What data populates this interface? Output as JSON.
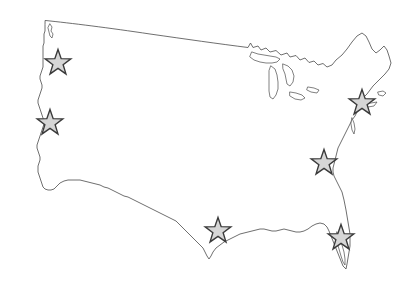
{
  "figure": {
    "background_color": "#ffffff",
    "width": 414,
    "height": 287
  },
  "map": {
    "region_name": "Contiguous United States",
    "outline_color": "#4a4a4a",
    "fill_color": "#ffffff",
    "lakes": [
      "Lake Superior",
      "Lake Michigan",
      "Lake Huron",
      "Lake Erie",
      "Lake Ontario"
    ]
  },
  "legend": {
    "marker_shape": "star",
    "marker_fill_color": "#d6d6d6",
    "marker_stroke_color": "#3a3a3a",
    "marker_count": 6
  },
  "markers": [
    {
      "id": "marker-northwest",
      "label": "Pacific Northwest",
      "x": 58,
      "y": 63,
      "size": 27,
      "rotation": 0
    },
    {
      "id": "marker-northern-california",
      "label": "Northern California",
      "x": 50,
      "y": 123,
      "size": 27,
      "rotation": 0
    },
    {
      "id": "marker-northeast",
      "label": "Northeast",
      "x": 362,
      "y": 103,
      "size": 27,
      "rotation": 0
    },
    {
      "id": "marker-mid-atlantic",
      "label": "Mid-Atlantic",
      "x": 324,
      "y": 163,
      "size": 27,
      "rotation": 0
    },
    {
      "id": "marker-texas",
      "label": "Texas Gulf Coast",
      "x": 218,
      "y": 231,
      "size": 27,
      "rotation": 0
    },
    {
      "id": "marker-florida",
      "label": "Florida",
      "x": 341,
      "y": 238,
      "size": 27,
      "rotation": 0
    }
  ],
  "paths": {
    "mainland": "M 45.5,20.5 C 70,23 110,28 150,34 C 185,39 220,44 248,47.5 L 250.5,43 L 253,47.5 L 258,46 L 261,50 L 266,48 L 270,52 L 276,50.5 L 281,55 L 287,53 L 290,57 L 296,55.5 L 300,60 L 305,58 L 309,62.5 L 314,61 L 318,65 L 323,63.5 L 327,67 L 332,65 L 336,60 L 342,55 L 347,49 L 352,42 L 357,36 L 362,33 L 366,36 L 369,42 L 372,49 L 376,53 L 380,50 L 384,46 L 387,50 L 389,56 L 391,63 L 389,69 L 385,74 L 381,78 L 377,82 L 373,86 L 370,90 L 367,94 L 364,97 L 362,100 L 360,104 L 359,108 L 357,112 L 355,116 L 352,120 L 350,124 L 348,128 L 346,132 L 344,136 L 342,140 L 340,144 L 338,148 L 337,152 L 336,156 L 335,160 L 334,164 L 333,168 L 333,172 L 334,176 L 336,180 L 338,184 L 340,188 L 342,192 L 343,196 L 344,200 L 345,205 L 346,210 L 347,216 L 348,222 L 349,228 L 350,234 L 350,240 L 350,246 L 349,252 L 348,258 L 347,264 L 346,269 L 343,266 L 341,261 L 339,256 L 337,251 L 335,246 L 333,241 L 331,236 L 329,231 L 327,227 L 324,224 L 320,223 L 316,224 L 312,226 L 308,229 L 304,231 L 300,232 L 296,232 L 292,231 L 288,230 L 284,229 L 280,230 L 276,231 L 272,231 L 268,230 L 264,229 L 260,229 L 256,230 L 252,231 L 248,232 L 244,233 L 240,234 L 236,236 L 232,238 L 228,240 L 224,242 L 220,245 L 216,248 L 213,252 L 211,256 L 209,259 L 207,256 L 205,252 L 203,248 L 200,245 L 197,242 L 194,239 L 191,236 L 188,233 L 185,230 L 182,227 L 179,224 L 176,221 L 172,219 L 168,217 L 164,215 L 160,213 L 156,211 L 152,209 L 148,207 L 144,205 L 140,203 L 136,201 L 132,199 L 128,197 L 124,196 L 120,194 L 116,192 L 112,190 L 108,188 L 104,187 L 100,185 L 96,184 L 92,183 L 88,182 L 84,181 L 80,180 L 76,180 L 72,180 L 68,180 L 64,181 L 60,183 L 57,186 L 54,189 L 51,190 L 48,190 L 45,189 L 43,187 L 42,184 L 41,181 L 40,178 L 39,175 L 38,172 L 38,169 L 38,166 L 39,163 L 40,160 L 40,157 L 39,154 L 38,151 L 37,148 L 37,145 L 38,142 L 39,139 L 40,136 L 41,133 L 42,130 L 43,127 L 44,124 L 44,121 L 43,118 L 42,115 L 41,112 L 40,109 L 39,106 L 38,103 L 38,100 L 39,97 L 40,94 L 41,91 L 42,88 L 42,85 L 41,82 L 40,79 L 40,76 L 41,73 L 42,70 L 43,67 L 43,64 L 43,61 L 43,58 L 43,55 L 43,52 L 43,49 L 43,46 L 44,43 L 44,40 L 44,37 L 44,34 L 45,31 L 45,28 L 45,25 Z",
    "puget_sound": "M 50,24 L 52,27 L 51,31 L 53,34 L 52,38 L 50,36 L 49,32 L 48,28 Z",
    "lake_superior": "M 252,52 L 258,54 L 264,55 L 270,56 L 276,57 L 280,59 L 277,62 L 272,63 L 266,63 L 260,62 L 254,60 L 250,57 Z",
    "lake_michigan": "M 271,66 L 275,69 L 277,75 L 278,82 L 278,89 L 276,95 L 273,99 L 270,97 L 269,91 L 269,84 L 269,77 L 269,71 Z",
    "lake_huron": "M 283,64 L 288,66 L 292,70 L 294,76 L 293,82 L 290,86 L 287,84 L 286,79 L 285,74 L 283,69 Z",
    "lake_erie": "M 290,92 L 296,93 L 302,95 L 305,98 L 301,100 L 295,99 L 290,96 Z",
    "lake_ontario": "M 308,87 L 314,88 L 319,90 L 317,93 L 311,92 L 307,90 Z",
    "florida_detail": "M 337,232 L 340,238 L 342,245 L 344,252 L 345,259 L 345,265 L 343,262 L 341,256 L 339,249 L 337,242 L 336,236 Z",
    "chesapeake": "M 352,118 L 354,123 L 355,129 L 354,134 L 352,130 L 351,124 Z",
    "cape_cod": "M 378,92 L 383,91 L 386,93 L 383,96 L 379,95 Z",
    "long_island": "M 364,104 L 371,103 L 377,102 L 374,106 L 368,107 Z"
  }
}
